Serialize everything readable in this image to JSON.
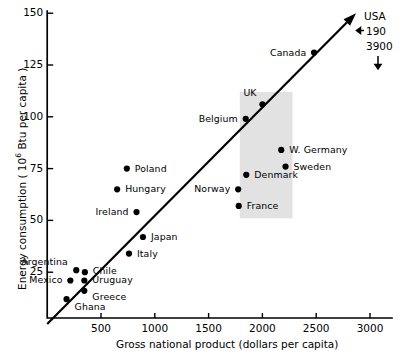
{
  "chart_data": {
    "type": "scatter",
    "title": "",
    "xlabel": "Gross national product  (dollars per capita)",
    "ylabel_prefix": "Energy consumption  ( 10",
    "ylabel_sup": "6",
    "ylabel_suffix": " Btu per capita )",
    "xlim": [
      0,
      3150
    ],
    "ylim": [
      0,
      152
    ],
    "xticks": [
      500,
      1000,
      1500,
      2000,
      2500,
      3000
    ],
    "xtick_labels": [
      "500",
      "1000",
      "1500",
      "2000",
      "2500",
      "3000"
    ],
    "yticks": [
      25,
      50,
      75,
      100,
      125,
      150
    ],
    "ytick_labels": [
      "25",
      "50",
      "75",
      "100",
      "125",
      "150"
    ],
    "grid": false,
    "legend": "none",
    "points": [
      {
        "name": "Ghana",
        "x": 180,
        "y": 12,
        "label_dx": 8,
        "label_dy": 8,
        "anchor": "start"
      },
      {
        "name": "Mexico",
        "x": 215,
        "y": 21,
        "label_dx": -8,
        "label_dy": 0,
        "anchor": "end"
      },
      {
        "name": "Greece",
        "x": 345,
        "y": 16,
        "label_dx": 8,
        "label_dy": 6,
        "anchor": "start"
      },
      {
        "name": "Uruguay",
        "x": 345,
        "y": 21,
        "label_dx": 8,
        "label_dy": 0,
        "anchor": "start"
      },
      {
        "name": "Argentina",
        "x": 270,
        "y": 26,
        "label_dx": -8,
        "label_dy": -8,
        "anchor": "end"
      },
      {
        "name": "Chile",
        "x": 350,
        "y": 25,
        "label_dx": 8,
        "label_dy": -1,
        "anchor": "start"
      },
      {
        "name": "Italy",
        "x": 760,
        "y": 34,
        "label_dx": 8,
        "label_dy": 0,
        "anchor": "start"
      },
      {
        "name": "Japan",
        "x": 890,
        "y": 42,
        "label_dx": 8,
        "label_dy": 0,
        "anchor": "start"
      },
      {
        "name": "Ireland",
        "x": 830,
        "y": 54,
        "label_dx": -8,
        "label_dy": 0,
        "anchor": "end"
      },
      {
        "name": "Hungary",
        "x": 650,
        "y": 65,
        "label_dx": 8,
        "label_dy": 0,
        "anchor": "start"
      },
      {
        "name": "Poland",
        "x": 740,
        "y": 75,
        "label_dx": 8,
        "label_dy": 0,
        "anchor": "start"
      },
      {
        "name": "France",
        "x": 1780,
        "y": 57,
        "label_dx": 8,
        "label_dy": 0,
        "anchor": "start"
      },
      {
        "name": "Norway",
        "x": 1775,
        "y": 65,
        "label_dx": -8,
        "label_dy": 0,
        "anchor": "end"
      },
      {
        "name": "Denmark",
        "x": 1850,
        "y": 72,
        "label_dx": 8,
        "label_dy": 0,
        "anchor": "start"
      },
      {
        "name": "Sweden",
        "x": 2215,
        "y": 76,
        "label_dx": 8,
        "label_dy": 0,
        "anchor": "start"
      },
      {
        "name": "W. Germany",
        "x": 2175,
        "y": 84,
        "label_dx": 8,
        "label_dy": 0,
        "anchor": "start"
      },
      {
        "name": "Belgium",
        "x": 1845,
        "y": 99,
        "label_dx": -8,
        "label_dy": 0,
        "anchor": "end"
      },
      {
        "name": "UK",
        "x": 2000,
        "y": 106,
        "label_dx": -6,
        "label_dy": -11,
        "anchor": "end"
      },
      {
        "name": "Canada",
        "x": 2480,
        "y": 131,
        "label_dx": -8,
        "label_dy": 0,
        "anchor": "end"
      }
    ],
    "trend_line": {
      "x_start": 0,
      "y_start": 0,
      "x_end": 2870,
      "y_end": 150,
      "has_arrow": true
    },
    "shaded_region": {
      "x_min": 1790,
      "x_max": 2280,
      "y_min": 51,
      "y_max": 112,
      "color": "#e2e2e2"
    },
    "annotations": [
      {
        "name": "usa-label",
        "text": "USA"
      },
      {
        "name": "usa-gnp-arrow",
        "text": "190"
      },
      {
        "name": "usa-energy-value",
        "text": "3900"
      }
    ]
  }
}
